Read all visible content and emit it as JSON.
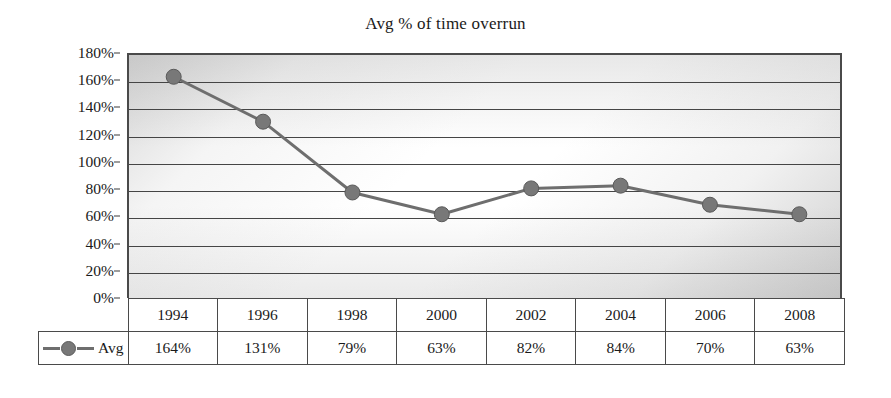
{
  "chart_data": {
    "type": "line",
    "title": "Avg % of time overrun",
    "xlabel": "",
    "ylabel": "",
    "categories": [
      "1994",
      "1996",
      "1998",
      "2000",
      "2002",
      "2004",
      "2006",
      "2008"
    ],
    "series": [
      {
        "name": "Avg",
        "values": [
          164,
          131,
          79,
          63,
          82,
          84,
          70,
          63
        ],
        "value_labels": [
          "164%",
          "131%",
          "79%",
          "63%",
          "82%",
          "84%",
          "70%",
          "63%"
        ],
        "color": "#6e6e6e",
        "marker": "circle"
      }
    ],
    "ylim": [
      0,
      180
    ],
    "y_ticks": [
      0,
      20,
      40,
      60,
      80,
      100,
      120,
      140,
      160,
      180
    ],
    "y_tick_labels": [
      "0%",
      "20%",
      "40%",
      "60%",
      "80%",
      "100%",
      "120%",
      "140%",
      "160%",
      "180%"
    ],
    "grid": true,
    "grid_axis": "y",
    "legend_position": "bottom-left-table",
    "data_table_shown": true
  },
  "colors": {
    "line": "#6e6e6e",
    "marker_fill": "#787878",
    "marker_stroke": "#5a5a5a",
    "gridline": "#454545",
    "axis": "#4a4a4a",
    "text": "#1a1a1a",
    "background": "#ffffff"
  },
  "legend": {
    "series_label": "Avg",
    "marker_icon": "line-with-circle-marker"
  }
}
